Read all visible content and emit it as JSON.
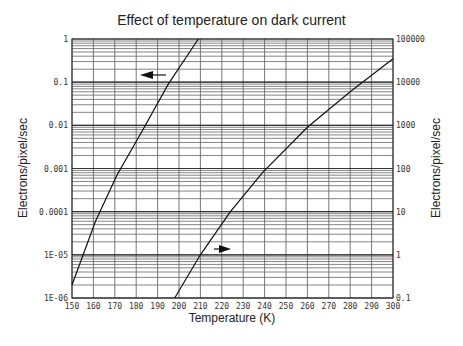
{
  "chart_data": {
    "type": "line",
    "title": "Effect of temperature on dark current",
    "xlabel": "Temperature (K)",
    "ylabel_left": "Electrons/pixel/sec",
    "ylabel_right": "Electrons/pixel/sec",
    "xlim": [
      150,
      300
    ],
    "ylim_left": [
      1e-06,
      1
    ],
    "ylim_right": [
      0.1,
      100000
    ],
    "yscale": "log",
    "grid": true,
    "x_ticks": [
      "150",
      "160",
      "170",
      "180",
      "190",
      "200",
      "210",
      "220",
      "230",
      "240",
      "250",
      "260",
      "270",
      "280",
      "290",
      "300"
    ],
    "y_left_ticks": [
      "1",
      "0.1",
      "0.01",
      "0.001",
      "0.0001",
      "1E-05",
      "1E-06"
    ],
    "y_right_ticks": [
      "100000",
      "10000",
      "1000",
      "100",
      "10",
      "1",
      "0.1"
    ],
    "series": [
      {
        "name": "Left axis curve",
        "axis": "left",
        "arrow": "left",
        "x": [
          150,
          161,
          171,
          183,
          195,
          209
        ],
        "y": [
          2e-06,
          6e-05,
          0.0007,
          0.0077,
          0.09,
          1
        ]
      },
      {
        "name": "Right axis curve",
        "axis": "right",
        "arrow": "right",
        "x": [
          198,
          210,
          224,
          239,
          260,
          280,
          300
        ],
        "y": [
          0.1,
          1,
          10,
          80,
          900,
          6000,
          35000
        ]
      }
    ]
  }
}
